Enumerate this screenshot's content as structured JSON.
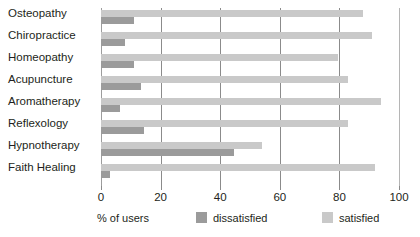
{
  "chart_data": {
    "type": "bar",
    "orientation": "horizontal",
    "title": "",
    "xlabel": "% of users",
    "ylabel": "",
    "xlim": [
      0,
      100
    ],
    "xticks": [
      0,
      20,
      40,
      60,
      80,
      100
    ],
    "xtick_labels": [
      "0",
      "20",
      "40",
      "60",
      "80",
      "100"
    ],
    "grid": true,
    "grid_axis": "x",
    "legend_position": "bottom",
    "categories": [
      "Osteopathy",
      "Chiropractice",
      "Homeopathy",
      "Acupuncture",
      "Aromatherapy",
      "Reflexology",
      "Hypnotherapy",
      "Faith Healing"
    ],
    "series": [
      {
        "name": "dissatisfied",
        "color": "#9b9b9b",
        "values": [
          11,
          8,
          11,
          13.5,
          6.5,
          14.5,
          44.5,
          3
        ]
      },
      {
        "name": "satisfied",
        "color": "#c9c9c9",
        "values": [
          88,
          91,
          79.5,
          83,
          94,
          83,
          54,
          92
        ]
      }
    ]
  },
  "legend": {
    "dissatisfied_label": "dissatisfied",
    "satisfied_label": "satisfied"
  },
  "axis": {
    "x_title": "% of users"
  }
}
